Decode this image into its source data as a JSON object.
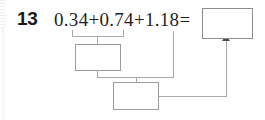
{
  "page": {
    "background_color": "#ffffff",
    "ink_color": "#1f1f1f",
    "line_color": "#a9a9a9"
  },
  "problem": {
    "number": "13",
    "expression": "0.34+0.74+1.18=",
    "terms": [
      "0.34",
      "0.74",
      "1.18"
    ],
    "operators": [
      "+",
      "+"
    ],
    "equals_sign": "="
  },
  "answer_box": {
    "label": "",
    "value": "",
    "placeholder": ""
  },
  "work_boxes": [
    {
      "name": "partial-sum-box",
      "value": "",
      "placeholder": ""
    },
    {
      "name": "total-sum-box",
      "value": "",
      "placeholder": ""
    }
  ],
  "annotations": {
    "bracket_label": "",
    "arrow_label": ""
  }
}
